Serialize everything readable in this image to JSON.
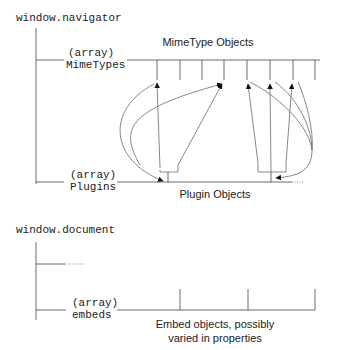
{
  "navigator": {
    "title": "window.navigator",
    "mimetypes_label_line1": "(array)",
    "mimetypes_label_line2": "MimeTypes",
    "mimetypes_caption": "MimeType Objects",
    "plugins_label_line1": "(array)",
    "plugins_label_line2": "Plugins",
    "plugins_caption": "Plugin Objects",
    "mimetype_tick_x": [
      157,
      180,
      202,
      224,
      247,
      270,
      293,
      315
    ],
    "plugin_tick_x": [
      168,
      271
    ]
  },
  "document": {
    "title": "window.document",
    "embeds_label_line1": "(array)",
    "embeds_label_line2": "embeds",
    "embeds_caption_line1": "Embed objects, possibly",
    "embeds_caption_line2": "varied in properties",
    "embed_tick_x": [
      180,
      248,
      315
    ]
  },
  "colors": {
    "line": "#6a6a6a",
    "text": "#222222",
    "arrow": "#111111"
  }
}
